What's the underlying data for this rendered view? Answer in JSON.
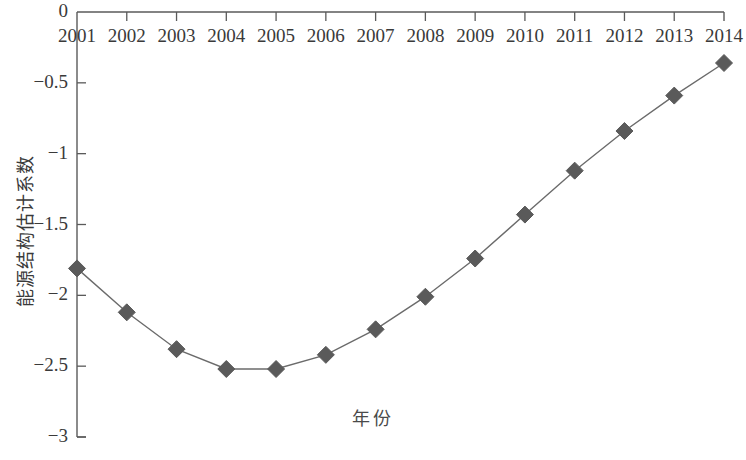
{
  "chart_data": {
    "type": "line",
    "title": "",
    "xlabel": "年份",
    "ylabel": "能源结构估计系数",
    "categories": [
      "2001",
      "2002",
      "2003",
      "2004",
      "2005",
      "2006",
      "2007",
      "2008",
      "2009",
      "2010",
      "2011",
      "2012",
      "2013",
      "2014"
    ],
    "values": [
      -1.81,
      -2.12,
      -2.38,
      -2.52,
      -2.52,
      -2.42,
      -2.24,
      -2.01,
      -1.74,
      -1.43,
      -1.12,
      -0.84,
      -0.59,
      -0.36
    ],
    "series": [
      {
        "name": "能源结构估计系数",
        "values": [
          -1.81,
          -2.12,
          -2.38,
          -2.52,
          -2.52,
          -2.42,
          -2.24,
          -2.01,
          -1.74,
          -1.43,
          -1.12,
          -0.84,
          -0.59,
          -0.36
        ]
      }
    ],
    "ylim": [
      -3,
      0
    ],
    "xlim": [
      "2001",
      "2014"
    ],
    "ytick_labels": [
      "0",
      "−0.5",
      "−1",
      "−1.5",
      "−2",
      "−2.5",
      "−3"
    ],
    "ytick_values": [
      0,
      -0.5,
      -1,
      -1.5,
      -2,
      -2.5,
      -3
    ],
    "xtick_labels": [
      "2001",
      "2002",
      "2003",
      "2004",
      "2005",
      "2006",
      "2007",
      "2008",
      "2009",
      "2010",
      "2011",
      "2012",
      "2013",
      "2014"
    ],
    "grid": false,
    "legend": false,
    "marker": "diamond",
    "line_color": "#6b6b6b",
    "marker_color": "#5a5a5a",
    "axis_color": "#5a5a5a"
  },
  "axes": {
    "y_axis_title": "能源结构估计系数",
    "x_axis_title": "年份",
    "y_ticks": [
      {
        "label": "0",
        "value": 0
      },
      {
        "label": "−0.5",
        "value": -0.5
      },
      {
        "label": "−1",
        "value": -1
      },
      {
        "label": "−1.5",
        "value": -1.5
      },
      {
        "label": "−2",
        "value": -2
      },
      {
        "label": "−2.5",
        "value": -2.5
      },
      {
        "label": "−3",
        "value": -3
      }
    ],
    "x_ticks": [
      {
        "label": "2001"
      },
      {
        "label": "2002"
      },
      {
        "label": "2003"
      },
      {
        "label": "2004"
      },
      {
        "label": "2005"
      },
      {
        "label": "2006"
      },
      {
        "label": "2007"
      },
      {
        "label": "2008"
      },
      {
        "label": "2009"
      },
      {
        "label": "2010"
      },
      {
        "label": "2011"
      },
      {
        "label": "2012"
      },
      {
        "label": "2013"
      },
      {
        "label": "2014"
      }
    ]
  }
}
